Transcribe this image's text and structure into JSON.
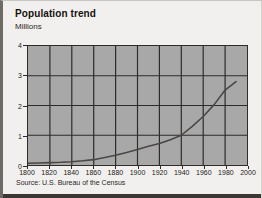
{
  "chart_data": {
    "type": "line",
    "title": "Population trend",
    "ylabel": "Millions",
    "xlabel": "",
    "source": "Source: U.S. Bureau of the Census",
    "xlim": [
      1800,
      2000
    ],
    "ylim": [
      0,
      4
    ],
    "xticks": [
      1800,
      1820,
      1840,
      1860,
      1880,
      1900,
      1920,
      1940,
      1960,
      1980,
      2000
    ],
    "yticks": [
      0,
      1,
      2,
      3,
      4
    ],
    "grid": true,
    "legend": null,
    "plot_background": "#a8a8a8",
    "line_color": "#4a4744",
    "x": [
      1800,
      1810,
      1820,
      1830,
      1840,
      1850,
      1860,
      1870,
      1880,
      1890,
      1900,
      1910,
      1920,
      1930,
      1940,
      1950,
      1960,
      1970,
      1980,
      1990
    ],
    "values": [
      0.06,
      0.07,
      0.08,
      0.09,
      0.11,
      0.14,
      0.18,
      0.25,
      0.33,
      0.42,
      0.52,
      0.63,
      0.72,
      0.85,
      1.0,
      1.3,
      1.63,
      2.03,
      2.52,
      2.8
    ],
    "series": [
      {
        "name": "Population",
        "values": [
          0.06,
          0.07,
          0.08,
          0.09,
          0.11,
          0.14,
          0.18,
          0.25,
          0.33,
          0.42,
          0.52,
          0.63,
          0.72,
          0.85,
          1.0,
          1.3,
          1.63,
          2.03,
          2.52,
          2.8
        ]
      }
    ]
  }
}
